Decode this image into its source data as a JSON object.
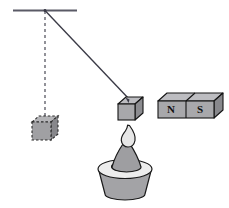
{
  "figure": {
    "background_color": "#ffffff",
    "line_color": "#3a3a46",
    "outline_color": "#1a1a1a"
  },
  "ceiling": {
    "name": "ceiling-support-bar",
    "x1": 13,
    "y1": 10.5,
    "x2": 77,
    "y2": 10.5,
    "color": "#5a5a66",
    "thickness": 2.2
  },
  "pivot": {
    "name": "pivot-point",
    "x": 45,
    "y": 10.5
  },
  "vertical_reference": {
    "name": "vertical-dashed-reference-line",
    "x1": 45,
    "y1": 11,
    "x2": 45,
    "y2": 118,
    "color": "#4a4a55",
    "dash": "3 3",
    "thickness": 1.2
  },
  "string": {
    "name": "pendulum-string",
    "x1": 45,
    "y1": 10.5,
    "x2": 129,
    "y2": 99,
    "color": "#3a3a46",
    "thickness": 1.3
  },
  "ghost_block": {
    "name": "dashed-rest-position-block",
    "style": "dashed-outline-cube",
    "fill": "#a0a0a3",
    "top_fill": "#b4b4b7",
    "side_fill": "#87878b",
    "stroke": "#2b2b2b",
    "dash": "2.5 2",
    "front": {
      "x": 32,
      "y": 122,
      "w": 19,
      "h": 18
    },
    "depth_x": 7,
    "depth_y": 6
  },
  "swung_block": {
    "name": "swung-block-cube",
    "style": "solid-cube",
    "front_fill": "#a8a8ab",
    "top_fill": "#bcbcc0",
    "side_fill": "#8c8c90",
    "stroke": "#141414",
    "front": {
      "x": 118,
      "y": 104,
      "w": 17,
      "h": 16
    },
    "depth_x": 8,
    "depth_y": 7
  },
  "magnet": {
    "name": "bar-magnet",
    "front_fill": "#a8a8ab",
    "top_fill": "#bdbdc1",
    "side_fill": "#88888c",
    "stroke": "#141414",
    "front": {
      "x": 158,
      "y": 101,
      "w": 56,
      "h": 17
    },
    "depth_x": 9,
    "depth_y": 8,
    "divider_x": 186,
    "poles": [
      {
        "label": "N",
        "cx": 171,
        "cy": 110
      },
      {
        "label": "S",
        "cx": 200,
        "cy": 110
      }
    ]
  },
  "burner": {
    "name": "burner-with-flame",
    "base": {
      "name": "burner-base",
      "fill": "#a3a3a6",
      "stroke": "#1a1a1a",
      "top_cx": 125,
      "top_cy": 172,
      "top_rx": 26,
      "top_ry": 8,
      "bottom_cx": 125,
      "bottom_cy": 198,
      "bottom_rx": 20,
      "bottom_ry": 6
    },
    "rim": {
      "name": "burner-rim",
      "fill": "#ededed",
      "stroke": "#1a1a1a",
      "cx": 125,
      "cy": 169,
      "rx": 27,
      "ry": 9
    },
    "inner_hole": {
      "name": "burner-inner-opening",
      "fill": "#a9a9ac",
      "stroke": "#1a1a1a",
      "cx": 125,
      "cy": 166,
      "rx": 13,
      "ry": 5
    },
    "wick_cone": {
      "name": "wick-cone",
      "fill": "#9e9ea1",
      "stroke": "#1a1a1a",
      "apex_x": 127,
      "apex_y": 138,
      "left_x": 112,
      "right_x": 142,
      "base_y": 167
    },
    "flame": {
      "name": "flame",
      "fill": "#e6e6e6",
      "stroke": "#1a1a1a",
      "tip_x": 130,
      "tip_y": 125
    }
  }
}
